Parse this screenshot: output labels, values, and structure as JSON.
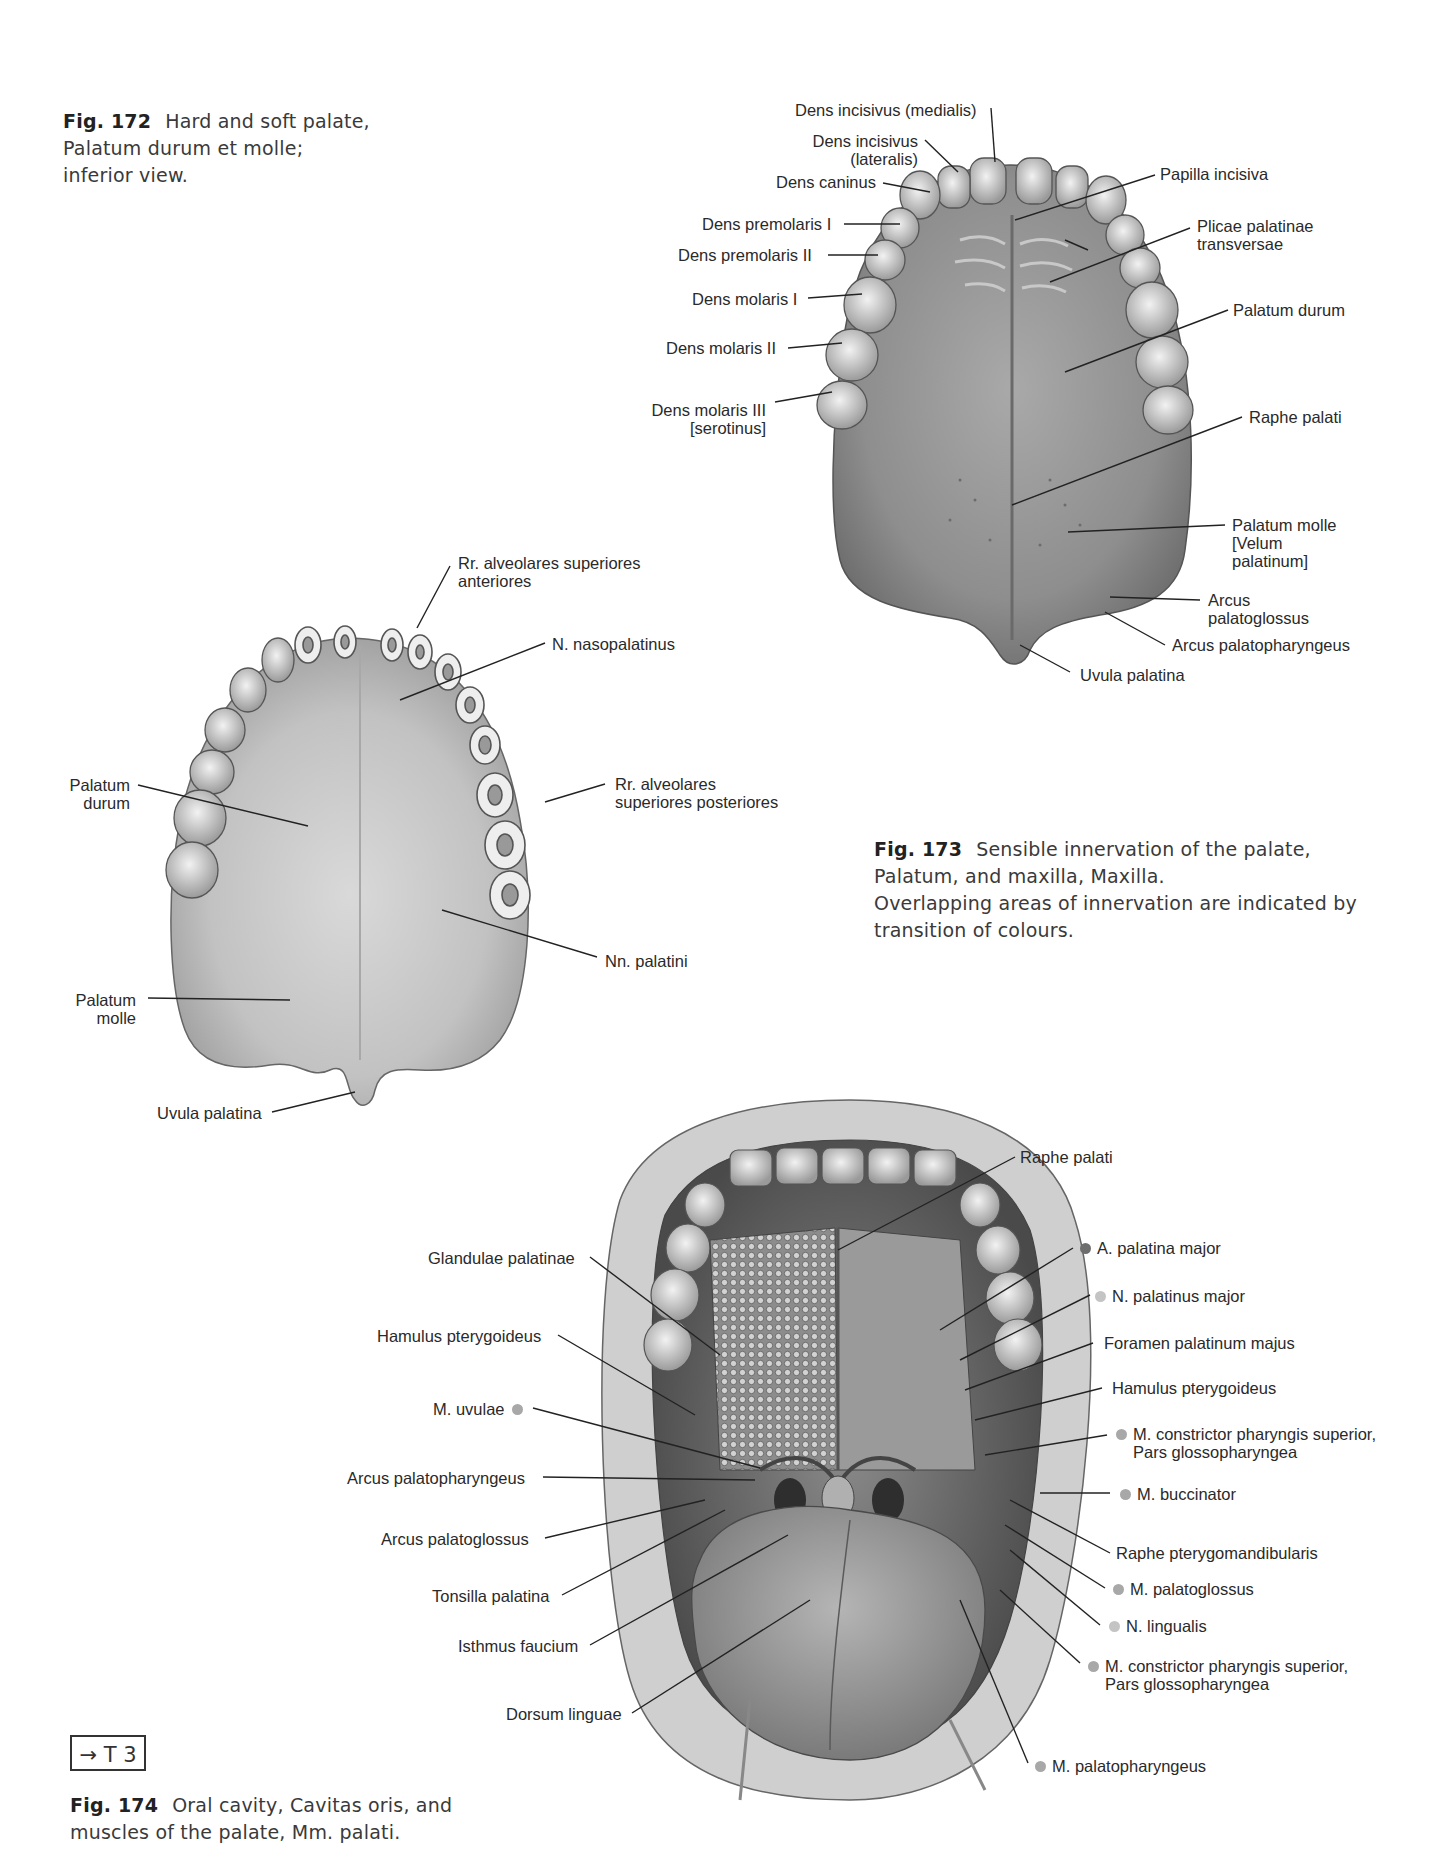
{
  "figures": {
    "fig172": {
      "number": "Fig. 172",
      "caption_lines": [
        "Hard and soft palate,",
        "Palatum durum et molle;",
        "inferior view."
      ],
      "labels": {
        "dens_incisivus_medialis": "Dens incisivus (medialis)",
        "dens_incisivus_lateralis_1": "Dens incisivus",
        "dens_incisivus_lateralis_2": "(lateralis)",
        "dens_caninus": "Dens caninus",
        "dens_premolaris_1": "Dens premolaris I",
        "dens_premolaris_2": "Dens premolaris II",
        "dens_molaris_1": "Dens molaris I",
        "dens_molaris_2": "Dens molaris II",
        "dens_molaris_3_1": "Dens molaris III",
        "dens_molaris_3_2": "[serotinus]",
        "papilla_incisiva": "Papilla incisiva",
        "plicae_1": "Plicae palatinae",
        "plicae_2": "transversae",
        "palatum_durum": "Palatum durum",
        "raphe_palati": "Raphe palati",
        "palatum_molle_1": "Palatum molle",
        "palatum_molle_2": "[Velum",
        "palatum_molle_3": "palatinum]",
        "arcus_palatoglossus_1": "Arcus",
        "arcus_palatoglossus_2": "palatoglossus",
        "arcus_palatopharyngeus": "Arcus palatopharyngeus",
        "uvula_palatina": "Uvula palatina"
      }
    },
    "fig173": {
      "number": "Fig. 173",
      "caption_lines": [
        "Sensible innervation of the palate,",
        "Palatum, and maxilla, Maxilla.",
        "Overlapping areas of innervation are indicated by",
        "transition of colours."
      ],
      "labels": {
        "rr_alv_ant_1": "Rr. alveolares superiores",
        "rr_alv_ant_2": "anteriores",
        "n_nasopalatinus": "N. nasopalatinus",
        "palatum_durum_1": "Palatum",
        "palatum_durum_2": "durum",
        "rr_alv_post_1": "Rr. alveolares",
        "rr_alv_post_2": "superiores posteriores",
        "nn_palatini": "Nn. palatini",
        "palatum_molle_1": "Palatum",
        "palatum_molle_2": "molle",
        "uvula_palatina": "Uvula palatina"
      }
    },
    "fig174": {
      "number": "Fig. 174",
      "caption_lines": [
        "Oral cavity, Cavitas oris, and",
        "muscles of the palate, Mm. palati."
      ],
      "cross_reference": "→ T 3",
      "labels_left": {
        "glandulae_palatinae": "Glandulae palatinae",
        "hamulus_pterygoideus": "Hamulus pterygoideus",
        "m_uvulae": "M. uvulae",
        "arcus_palatopharyngeus": "Arcus palatopharyngeus",
        "arcus_palatoglossus": "Arcus palatoglossus",
        "tonsilla_palatina": "Tonsilla palatina",
        "isthmus_faucium": "Isthmus faucium",
        "dorsum_linguae": "Dorsum linguae"
      },
      "labels_right": {
        "raphe_palati": "Raphe palati",
        "a_palatina_major": "A. palatina major",
        "n_palatinus_major": "N. palatinus major",
        "foramen_palatinum_majus": "Foramen palatinum majus",
        "hamulus_pterygoideus": "Hamulus pterygoideus",
        "m_constrictor_1a": "M. constrictor pharyngis superior,",
        "m_constrictor_1b": "Pars glossopharyngea",
        "m_buccinator": "M. buccinator",
        "raphe_pterygomandibularis": "Raphe pterygomandibularis",
        "m_palatoglossus": "M. palatoglossus",
        "n_lingualis": "N. lingualis",
        "m_constrictor_2a": "M. constrictor pharyngis superior,",
        "m_constrictor_2b": "Pars glossopharyngea",
        "m_palatopharyngeus": "M. palatopharyngeus"
      },
      "legend_colors": {
        "artery": "#6e6e6e",
        "nerve": "#c4c4c4",
        "muscle": "#a8a8a8"
      }
    }
  }
}
